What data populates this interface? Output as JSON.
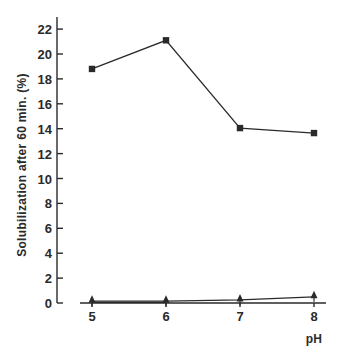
{
  "chart_data": {
    "type": "line",
    "title": "",
    "xlabel": "pH",
    "ylabel": "Solubilization after 60 min. (%)",
    "x": [
      5,
      6,
      7,
      8
    ],
    "x_tick_labels": [
      "5",
      "6",
      "7",
      "8"
    ],
    "y_ticks": [
      0,
      2,
      4,
      6,
      8,
      10,
      12,
      14,
      16,
      18,
      20,
      22
    ],
    "y_tick_labels": [
      "0",
      "2",
      "4",
      "6",
      "8",
      "10",
      "12",
      "14",
      "16",
      "18",
      "20",
      "22"
    ],
    "ylim": [
      0,
      23
    ],
    "xlim": [
      4.87,
      8.15
    ],
    "grid": false,
    "legend": "none",
    "series": [
      {
        "name": "squares",
        "marker": "square",
        "values": [
          18.8,
          21.1,
          14.05,
          13.65
        ]
      },
      {
        "name": "triangles",
        "marker": "triangle",
        "values": [
          0.15,
          0.15,
          0.25,
          0.5
        ]
      },
      {
        "name": "baseline",
        "marker": "none",
        "values": [
          0.05,
          0.05,
          null,
          null
        ]
      }
    ]
  },
  "colors": {
    "ink": "#2a2a2a",
    "background": "#ffffff"
  }
}
